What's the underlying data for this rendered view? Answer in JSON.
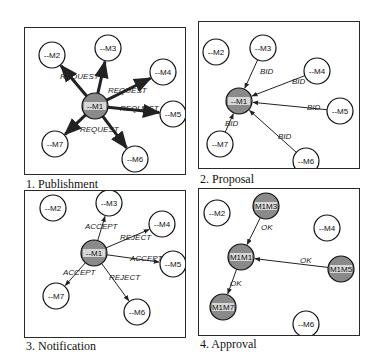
{
  "figure": {
    "panels": [
      {
        "caption": "1. Publishment",
        "nodes": [
          {
            "id": "M1",
            "label": "--M1",
            "x": 70,
            "y": 78,
            "style": "hatched"
          },
          {
            "id": "M2",
            "label": "--M2",
            "x": 27,
            "y": 27,
            "style": "plain"
          },
          {
            "id": "M3",
            "label": "--M3",
            "x": 83,
            "y": 20,
            "style": "plain"
          },
          {
            "id": "M4",
            "label": "--M4",
            "x": 138,
            "y": 44,
            "style": "plain"
          },
          {
            "id": "M5",
            "label": "--M5",
            "x": 148,
            "y": 86,
            "style": "plain"
          },
          {
            "id": "M7",
            "label": "--M7",
            "x": 30,
            "y": 116,
            "style": "plain"
          },
          {
            "id": "M6",
            "label": "--M6",
            "x": 110,
            "y": 131,
            "style": "plain"
          }
        ],
        "edges": [
          {
            "from": "M1",
            "to": "M2",
            "label": "REQUEST",
            "lx": 35,
            "ly": 51,
            "bold": true
          },
          {
            "from": "M1",
            "to": "M3",
            "label": "",
            "lx": 0,
            "ly": 0,
            "bold": true
          },
          {
            "from": "M1",
            "to": "M4",
            "label": "REQUEST",
            "lx": 83,
            "ly": 65,
            "bold": true
          },
          {
            "from": "M1",
            "to": "M5",
            "label": "REQUEST",
            "lx": 95,
            "ly": 83,
            "bold": true
          },
          {
            "from": "M1",
            "to": "M7",
            "label": "REQUEST",
            "lx": 55,
            "ly": 104,
            "bold": true
          },
          {
            "from": "M1",
            "to": "M6",
            "label": "",
            "lx": 0,
            "ly": 0,
            "bold": true
          }
        ]
      },
      {
        "caption": "2.  Proposal",
        "nodes": [
          {
            "id": "M1",
            "label": "--M1",
            "x": 40,
            "y": 79,
            "style": "hatched"
          },
          {
            "id": "M2",
            "label": "--M2",
            "x": 17,
            "y": 30,
            "style": "plain"
          },
          {
            "id": "M3",
            "label": "--M3",
            "x": 64,
            "y": 26,
            "style": "plain"
          },
          {
            "id": "M4",
            "label": "--M4",
            "x": 118,
            "y": 49,
            "style": "plain"
          },
          {
            "id": "M5",
            "label": "--M5",
            "x": 141,
            "y": 89,
            "style": "plain"
          },
          {
            "id": "M7",
            "label": "--M7",
            "x": 21,
            "y": 122,
            "style": "plain"
          },
          {
            "id": "M6",
            "label": "--M6",
            "x": 107,
            "y": 139,
            "style": "plain"
          }
        ],
        "edges": [
          {
            "from": "M3",
            "to": "M1",
            "label": "BID",
            "lx": 61,
            "ly": 52,
            "bold": false
          },
          {
            "from": "M4",
            "to": "M1",
            "label": "BID",
            "lx": 93,
            "ly": 62,
            "bold": false
          },
          {
            "from": "M5",
            "to": "M1",
            "label": "BID",
            "lx": 108,
            "ly": 88,
            "bold": false
          },
          {
            "from": "M7",
            "to": "M1",
            "label": "BID",
            "lx": 26,
            "ly": 104,
            "bold": false
          },
          {
            "from": "M6",
            "to": "M1",
            "label": "BID",
            "lx": 79,
            "ly": 117,
            "bold": false
          }
        ]
      },
      {
        "caption": "3. Notification",
        "nodes": [
          {
            "id": "M1",
            "label": "--M1",
            "x": 69,
            "y": 62,
            "style": "hatched"
          },
          {
            "id": "M2",
            "label": "--M2",
            "x": 28,
            "y": 17,
            "style": "plain"
          },
          {
            "id": "M3",
            "label": "--M3",
            "x": 84,
            "y": 12,
            "style": "plain"
          },
          {
            "id": "M4",
            "label": "--M4",
            "x": 137,
            "y": 33,
            "style": "plain"
          },
          {
            "id": "M5",
            "label": "--M5",
            "x": 148,
            "y": 73,
            "style": "plain"
          },
          {
            "id": "M7",
            "label": "--M7",
            "x": 31,
            "y": 105,
            "style": "plain"
          },
          {
            "id": "M6",
            "label": "--M6",
            "x": 112,
            "y": 121,
            "style": "plain"
          }
        ],
        "edges": [
          {
            "from": "M1",
            "to": "M3",
            "label": "ACCEPT",
            "lx": 60,
            "ly": 38,
            "bold": false
          },
          {
            "from": "M1",
            "to": "M4",
            "label": "REJECT",
            "lx": 95,
            "ly": 49,
            "bold": false
          },
          {
            "from": "M1",
            "to": "M5",
            "label": "ACCEPT",
            "lx": 105,
            "ly": 70,
            "bold": false
          },
          {
            "from": "M1",
            "to": "M7",
            "label": "ACCEPT",
            "lx": 38,
            "ly": 84,
            "bold": false
          },
          {
            "from": "M1",
            "to": "M6",
            "label": "REJECT",
            "lx": 84,
            "ly": 89,
            "bold": false
          }
        ]
      },
      {
        "caption": "4. Approval",
        "nodes": [
          {
            "id": "M1",
            "label": "M1M1",
            "x": 42,
            "y": 68,
            "style": "hatched"
          },
          {
            "id": "M2",
            "label": "--M2",
            "x": 18,
            "y": 24,
            "style": "plain"
          },
          {
            "id": "M3",
            "label": "M1M3",
            "x": 67,
            "y": 17,
            "style": "hatched"
          },
          {
            "id": "M4",
            "label": "--M4",
            "x": 128,
            "y": 39,
            "style": "plain"
          },
          {
            "id": "M5",
            "label": "M1M5",
            "x": 142,
            "y": 80,
            "style": "hatched"
          },
          {
            "id": "M7",
            "label": "M1M7",
            "x": 24,
            "y": 118,
            "style": "hatched"
          },
          {
            "id": "M6",
            "label": "--M6",
            "x": 107,
            "y": 135,
            "style": "plain"
          }
        ],
        "edges": [
          {
            "from": "M3",
            "to": "M1",
            "label": "OK",
            "lx": 62,
            "ly": 41,
            "bold": false
          },
          {
            "from": "M5",
            "to": "M1",
            "label": "OK",
            "lx": 101,
            "ly": 74,
            "bold": false
          },
          {
            "from": "M1",
            "to": "M7",
            "label": "OK",
            "lx": 31,
            "ly": 97,
            "bold": false
          }
        ]
      }
    ]
  },
  "colors": {
    "hatched_fill": "#8a8a8a",
    "hatched_band": "#d8d8d8",
    "border": "#2a2a2a"
  }
}
